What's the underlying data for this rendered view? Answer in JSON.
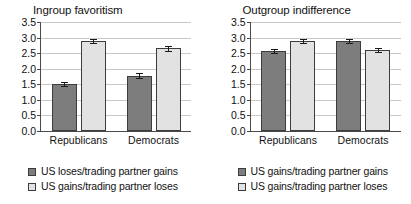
{
  "chart_data": [
    {
      "type": "bar",
      "panel": "left",
      "title": "Ingroup favoritism",
      "xlabel": "",
      "ylabel": "",
      "ylim": [
        0.0,
        3.5
      ],
      "ytick_labels": [
        "3.5",
        "3.0",
        "2.5",
        "2.0",
        "1.5",
        "1.0",
        "0.5",
        "0.0"
      ],
      "ytick_values": [
        3.5,
        3.0,
        2.5,
        2.0,
        1.5,
        1.0,
        0.5,
        0.0
      ],
      "grid": true,
      "legend_position": "below",
      "categories": [
        "Republicans",
        "Democrats"
      ],
      "series": [
        {
          "name": "US loses/trading partner gains",
          "color": "#7d7d7d",
          "values": [
            1.5,
            1.78
          ],
          "errors": [
            0.07,
            0.09
          ]
        },
        {
          "name": "US gains/trading partner loses",
          "color": "#e2e2e2",
          "values": [
            2.9,
            2.65
          ],
          "errors": [
            0.07,
            0.07
          ]
        }
      ]
    },
    {
      "type": "bar",
      "panel": "right",
      "title": "Outgroup indifference",
      "xlabel": "",
      "ylabel": "",
      "ylim": [
        0.0,
        3.5
      ],
      "ytick_labels": [
        "3.5",
        "3.0",
        "2.5",
        "2.0",
        "1.5",
        "1.0",
        "0.5",
        "0.0"
      ],
      "ytick_values": [
        3.5,
        3.0,
        2.5,
        2.0,
        1.5,
        1.0,
        0.5,
        0.0
      ],
      "grid": true,
      "legend_position": "below",
      "categories": [
        "Republicans",
        "Democrats"
      ],
      "series": [
        {
          "name": "US gains/trading partner gains",
          "color": "#7d7d7d",
          "values": [
            2.57,
            2.89
          ],
          "errors": [
            0.07,
            0.08
          ]
        },
        {
          "name": "US gains/trading partner loses",
          "color": "#e2e2e2",
          "values": [
            2.9,
            2.61
          ],
          "errors": [
            0.07,
            0.07
          ]
        }
      ]
    }
  ],
  "left": {
    "title": "Ingroup favoritism",
    "categories": [
      "Republicans",
      "Democrats"
    ],
    "yticks": [
      "3.5",
      "3.0",
      "2.5",
      "2.0",
      "1.5",
      "1.0",
      "0.5",
      "0.0"
    ],
    "legend": [
      "US loses/trading partner gains",
      "US gains/trading partner loses"
    ]
  },
  "right": {
    "title": "Outgroup indifference",
    "categories": [
      "Republicans",
      "Democrats"
    ],
    "yticks": [
      "3.5",
      "3.0",
      "2.5",
      "2.0",
      "1.5",
      "1.0",
      "0.5",
      "0.0"
    ],
    "legend": [
      "US gains/trading partner gains",
      "US gains/trading partner loses"
    ]
  },
  "colors": {
    "series_dark": "#7d7d7d",
    "series_light": "#e2e2e2",
    "axis": "#4a4a4a",
    "grid": "#c8c8c8",
    "text": "#111111"
  }
}
